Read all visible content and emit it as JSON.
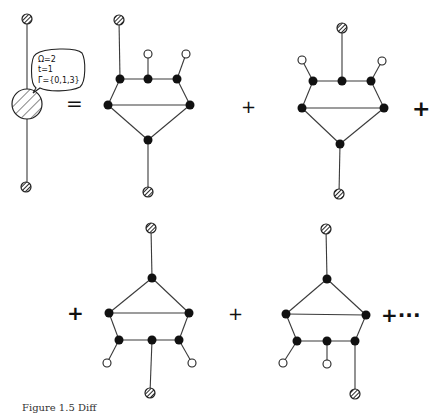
{
  "figure": {
    "label": {
      "line1": "Ω=2",
      "line2": "t=1",
      "line3": "Γ̄={0,1,3}"
    },
    "operators": {
      "equals": "=",
      "plus": "+",
      "ellipsis": "+···"
    },
    "legend": {
      "black_node": "internal vertex (filled black)",
      "open_node": "open vertex (white)",
      "hatched_node": "hatched external point"
    },
    "terms": [
      {
        "name": "term-1",
        "position": "top-left"
      },
      {
        "name": "term-2",
        "position": "top-right"
      },
      {
        "name": "term-3",
        "position": "bottom-left"
      },
      {
        "name": "term-4",
        "position": "bottom-right"
      }
    ],
    "caption": "Figure 1.5  Diff"
  },
  "colors": {
    "ink": "#111111",
    "edge": "#3a3a3a",
    "background": "#ffffff"
  }
}
